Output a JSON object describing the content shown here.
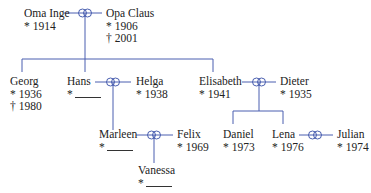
{
  "colors": {
    "line": "#4a5fb0",
    "text": "#222222"
  },
  "symbols": {
    "born": "*",
    "died": "†",
    "marriage": "marriage-rings-icon"
  },
  "people": {
    "oma_inge": {
      "name": "Oma Inge",
      "born": "1914"
    },
    "opa_claus": {
      "name": "Opa Claus",
      "born": "1906",
      "died": "2001"
    },
    "georg": {
      "name": "Georg",
      "born": "1936",
      "died": "1980"
    },
    "hans": {
      "name": "Hans",
      "born": ""
    },
    "helga": {
      "name": "Helga",
      "born": "1938"
    },
    "elisabeth": {
      "name": "Elisabeth",
      "born": "1941"
    },
    "dieter": {
      "name": "Dieter",
      "born": "1935"
    },
    "marleen": {
      "name": "Marleen",
      "born": ""
    },
    "felix": {
      "name": "Felix",
      "born": "1969"
    },
    "vanessa": {
      "name": "Vanessa",
      "born": ""
    },
    "daniel": {
      "name": "Daniel",
      "born": "1973"
    },
    "lena": {
      "name": "Lena",
      "born": "1976"
    },
    "julian": {
      "name": "Julian",
      "born": "1974"
    }
  },
  "couples": [
    [
      "Oma Inge",
      "Opa Claus"
    ],
    [
      "Hans",
      "Helga"
    ],
    [
      "Elisabeth",
      "Dieter"
    ],
    [
      "Marleen",
      "Felix"
    ],
    [
      "Lena",
      "Julian"
    ]
  ]
}
